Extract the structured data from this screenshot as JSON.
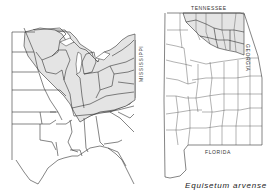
{
  "figure": {
    "caption": "Equisetum arvense",
    "panels": [
      {
        "name": "eastern-united-states",
        "description": "Eastern US state outline map with shaded range across northern states"
      },
      {
        "name": "alabama-counties",
        "description": "Alabama county outline map with shaded northern counties"
      }
    ],
    "labels": {
      "tennessee": "TENNESSEE",
      "mississippi": "MISSISSIPPI",
      "georgia": "GEORGIA",
      "florida": "FLORIDA"
    },
    "colors": {
      "shaded_range": "#e4e4e4",
      "outline": "#333333",
      "background": "#ffffff"
    }
  }
}
